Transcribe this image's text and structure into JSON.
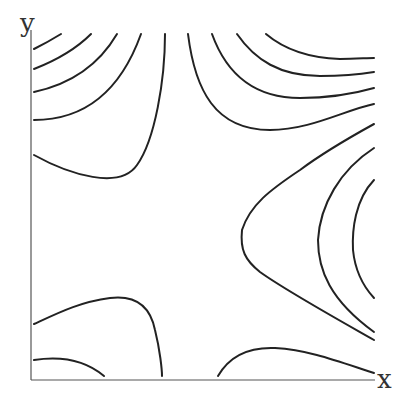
{
  "axes": {
    "x_label": "x",
    "y_label": "y"
  },
  "figure": {
    "type": "contour-plot",
    "line_color": "#222222",
    "axis_color": "#555555"
  }
}
